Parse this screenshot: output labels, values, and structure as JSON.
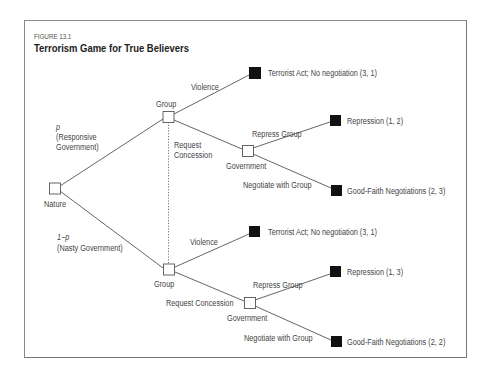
{
  "figure": {
    "number": "FIGURE 13.1",
    "title": "Terrorism Game for True Believers"
  },
  "nodes": {
    "nature": {
      "label": "Nature"
    },
    "group_responsive": {
      "label": "Group"
    },
    "government_responsive": {
      "label": "Government"
    },
    "group_nasty": {
      "label": "Group"
    },
    "government_nasty": {
      "label": "Government"
    }
  },
  "branches": {
    "nature_upper": {
      "probability": "p",
      "label": "(Responsive",
      "label2": "Government)"
    },
    "nature_lower": {
      "probability": "1−p",
      "label": "(Nasty Government)"
    },
    "upper_violence": "Violence",
    "upper_request_line1": "Request",
    "upper_request_line2": "Concession",
    "upper_repress": "Repress Group",
    "upper_negotiate": "Negotiate with Group",
    "lower_violence": "Violence",
    "lower_request": "Request Concession",
    "lower_repress": "Repress Group",
    "lower_negotiate": "Negotiate with Group"
  },
  "outcomes": [
    {
      "label": "Terrorist Act; No negotiation (3, 1)"
    },
    {
      "label": "Repression (1, 2)"
    },
    {
      "label": "Good-Faith Negotiations (2, 3)"
    },
    {
      "label": "Terrorist Act; No negotiation (3, 1)"
    },
    {
      "label": "Repression (1, 3)"
    },
    {
      "label": "Good-Faith Negotiations (2, 2)"
    }
  ],
  "colors": {
    "line": "#555555",
    "terminal": "#111111",
    "decision_node_fill": "#ffffff"
  }
}
